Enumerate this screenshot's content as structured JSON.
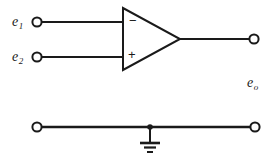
{
  "diagram": {
    "type": "electrical-circuit-schematic",
    "background_color": "#ffffff",
    "line_color": "#1a1a1a",
    "labels": {
      "input_1": "e",
      "input_1_sub": "1",
      "input_2": "e",
      "input_2_sub": "2",
      "output": "e",
      "output_sub": "o",
      "inverting_sign": "−",
      "noninverting_sign": "+"
    },
    "terminals": [
      {
        "name": "input-1-terminal",
        "x": 37,
        "y": 22
      },
      {
        "name": "input-2-terminal",
        "x": 37,
        "y": 57
      },
      {
        "name": "output-terminal",
        "x": 254,
        "y": 39
      },
      {
        "name": "common-left-terminal",
        "x": 37,
        "y": 127
      },
      {
        "name": "common-right-terminal",
        "x": 255,
        "y": 127
      }
    ],
    "amplifier": {
      "name": "op-amp-triangle",
      "left_edge_x": 123,
      "top_y": 8,
      "bottom_y": 70,
      "apex_x": 180,
      "apex_y": 39
    },
    "ground": {
      "name": "ground-symbol",
      "junction_x": 150,
      "junction_y": 127,
      "stem_bottom_y": 142,
      "bar_widths": [
        20,
        12,
        6
      ],
      "bar_ys": [
        143,
        147.5,
        152
      ]
    }
  }
}
